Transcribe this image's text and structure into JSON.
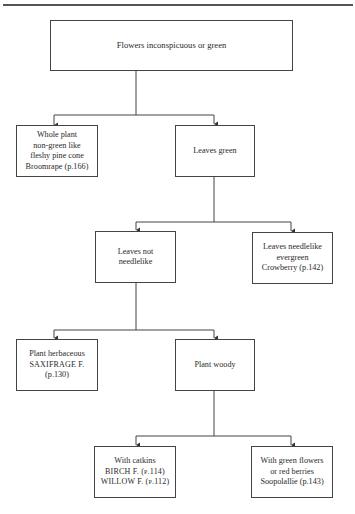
{
  "diagram": {
    "type": "flowchart-key",
    "nodes": {
      "root": {
        "lines": [
          "Flowers inconspicuous or green"
        ]
      },
      "whole_plant": {
        "lines": [
          "Whole plant",
          "non-green like",
          "fleshy pine cone",
          "Broomrape (p.166)"
        ]
      },
      "leaves_green": {
        "lines": [
          "Leaves green"
        ]
      },
      "leaves_not_needlelike": {
        "lines": [
          "Leaves not",
          "needlelike"
        ]
      },
      "leaves_needlelike": {
        "lines": [
          "Leaves needlelike",
          "evergreen",
          "Crowberry (p.142)"
        ]
      },
      "plant_herbaceous": {
        "lines": [
          "Plant herbaceous",
          "SAXIFRAGE F.",
          "(p.130)"
        ]
      },
      "plant_woody": {
        "lines": [
          "Plant woody"
        ]
      },
      "with_catkins": {
        "lines": [
          "With catkins",
          "BIRCH F. (p.114)",
          "WILLOW F. (p.112)"
        ]
      },
      "green_flowers": {
        "lines": [
          "With green flowers",
          "or red berries",
          "Soopolallie (p.143)"
        ]
      }
    },
    "edges": [
      [
        "root",
        "whole_plant"
      ],
      [
        "root",
        "leaves_green"
      ],
      [
        "leaves_green",
        "leaves_not_needlelike"
      ],
      [
        "leaves_green",
        "leaves_needlelike"
      ],
      [
        "leaves_not_needlelike",
        "plant_herbaceous"
      ],
      [
        "leaves_not_needlelike",
        "plant_woody"
      ],
      [
        "plant_woody",
        "with_catkins"
      ],
      [
        "plant_woody",
        "green_flowers"
      ]
    ]
  }
}
